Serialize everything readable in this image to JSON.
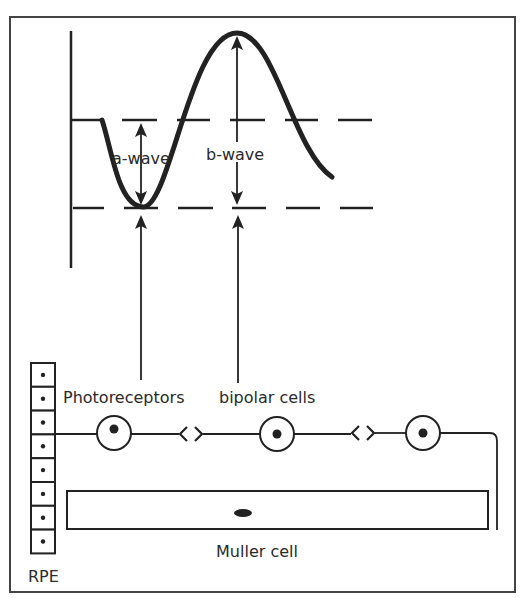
{
  "diagram": {
    "colors": {
      "ink": "#222222",
      "frame": "#444444",
      "background": "#ffffff"
    },
    "frame": {
      "x": 10,
      "y": 17,
      "w": 505,
      "h": 575
    },
    "erg": {
      "axis": {
        "x": 71,
        "y1": 31,
        "y2": 268
      },
      "baseline_y": 120,
      "trough_y": 208,
      "baseline_solid": {
        "x1": 71,
        "x2": 102
      },
      "upper_dashes": [
        [
          122,
          157
        ],
        [
          177,
          210
        ],
        [
          230,
          265
        ],
        [
          285,
          318
        ],
        [
          338,
          372
        ]
      ],
      "lower_dashes": [
        [
          73,
          104
        ],
        [
          124,
          158
        ],
        [
          178,
          213
        ],
        [
          232,
          266
        ],
        [
          286,
          320
        ],
        [
          340,
          373
        ]
      ],
      "curve_path": "M102,120 C112,150 118,206 143,207 C170,208 190,33 237,33 C275,33 292,150 332,177",
      "labels": {
        "a_wave": "a-wave",
        "b_wave": "b-wave"
      },
      "a_wave_arrow": {
        "x": 141,
        "y1": 123,
        "y2": 205
      },
      "b_wave_arrow": {
        "x": 237,
        "y1": 36,
        "y2": 205
      }
    },
    "origin_arrows": [
      {
        "target": "a-wave",
        "x": 141,
        "from_y": 380,
        "to_y": 215
      },
      {
        "target": "b-wave",
        "x": 238,
        "from_y": 383,
        "to_y": 215
      }
    ],
    "cells": {
      "labels": {
        "photoreceptors": "Photoreceptors",
        "bipolar": "bipolar cells",
        "muller": "Muller cell",
        "rpe": "RPE"
      },
      "rpe": {
        "x": 31,
        "y": 363,
        "w": 24,
        "count": 8,
        "cell_h": 23.8
      },
      "chain_y": 434,
      "neurons": [
        {
          "name": "photoreceptor",
          "cx": 114,
          "cy": 433,
          "r": 17,
          "nucleus_dy": -4
        },
        {
          "name": "bipolar",
          "cx": 277,
          "cy": 434,
          "r": 17,
          "nucleus_dy": 0
        },
        {
          "name": "ganglion",
          "cx": 423,
          "cy": 433,
          "r": 17,
          "nucleus_dy": 0
        }
      ],
      "synapses": [
        {
          "x": 191,
          "y": 434
        },
        {
          "x": 363,
          "y": 433
        }
      ],
      "muller": {
        "x": 67,
        "y": 491,
        "w": 421,
        "h": 38,
        "nucleus": {
          "cx": 243,
          "cy": 513,
          "rx": 9,
          "ry": 4
        }
      }
    }
  }
}
